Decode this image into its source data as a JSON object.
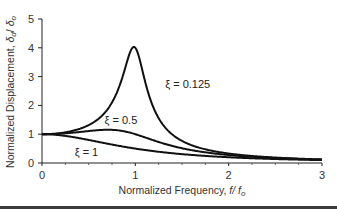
{
  "chart_data": {
    "type": "line",
    "title": "",
    "xlabel": "Normalized Frequency, f/f_o",
    "xlabel_parts": {
      "main": "Normalized Frequency, ",
      "italic": "f/ f",
      "sub": "o"
    },
    "ylabel": "Normalized Displacement, δ_d/δ_o",
    "ylabel_parts": {
      "main": "Normalized Displacement, ",
      "d1": "δ",
      "sub1": "d",
      "slash": "/ ",
      "d2": "δ",
      "sub2": "o"
    },
    "xlim": [
      0,
      3
    ],
    "ylim": [
      0,
      5
    ],
    "xticks": [
      0,
      1,
      2,
      3
    ],
    "yticks": [
      0,
      1,
      2,
      3,
      4,
      5
    ],
    "x_minor_ticks": [
      0.25,
      0.5,
      0.75,
      1.25,
      1.5,
      1.75,
      2.25,
      2.5,
      2.75
    ],
    "grid": false,
    "legend": "inline labels",
    "series": [
      {
        "name": "ξ = 0.125",
        "zeta": 0.125,
        "x": [
          0,
          0.25,
          0.5,
          0.75,
          0.9,
          1.0,
          1.1,
          1.25,
          1.5,
          2.0,
          2.5,
          3.0
        ],
        "values": [
          1.0,
          1.07,
          1.32,
          2.05,
          3.0,
          4.0,
          2.95,
          1.52,
          0.77,
          0.33,
          0.19,
          0.125
        ]
      },
      {
        "name": "ξ = 0.5",
        "zeta": 0.5,
        "x": [
          0,
          0.25,
          0.5,
          0.75,
          1.0,
          1.25,
          1.5,
          2.0,
          2.5,
          3.0
        ],
        "values": [
          1.0,
          1.06,
          1.11,
          1.11,
          1.0,
          0.81,
          0.63,
          0.38,
          0.25,
          0.17
        ]
      },
      {
        "name": "ξ = 1",
        "zeta": 1,
        "x": [
          0,
          0.25,
          0.5,
          0.75,
          1.0,
          1.5,
          2.0,
          2.5,
          3.0
        ],
        "values": [
          1.0,
          0.94,
          0.8,
          0.64,
          0.5,
          0.31,
          0.2,
          0.14,
          0.1
        ]
      }
    ],
    "annotations": [
      {
        "text": "ξ = 0.125",
        "x": 1.32,
        "y": 2.6
      },
      {
        "text": "ξ = 0.5",
        "x": 0.67,
        "y": 1.35
      },
      {
        "text": "ξ = 1",
        "x": 0.35,
        "y": 0.25
      }
    ]
  }
}
